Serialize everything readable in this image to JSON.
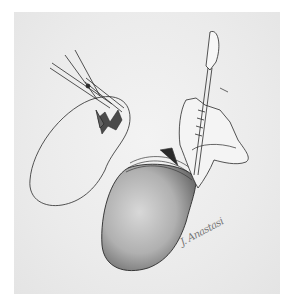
{
  "illustration": {
    "description": "Pencil surgical illustration: scissors incising a kidney-shaped organ (left) and a hand holding a scalpel over a shaded organ wrapped at the hilum (right)",
    "colors": {
      "paper": "#ececec",
      "line": "#2a2a2a",
      "shade": "#9a9a9a",
      "background": "#ffffff"
    },
    "signature": "J. Anastasi",
    "icons": [
      "scissors-icon",
      "scalpel-icon",
      "hand-icon"
    ]
  }
}
